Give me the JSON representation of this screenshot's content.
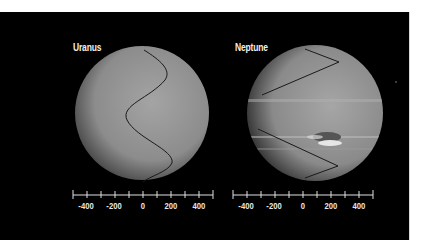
{
  "planets": [
    {
      "name": "Uranus",
      "scale": {
        "ticks": [
          "-400",
          "-200",
          "0",
          "200",
          "400"
        ]
      }
    },
    {
      "name": "Neptune",
      "scale": {
        "ticks": [
          "-400",
          "-200",
          "0",
          "200",
          "400"
        ]
      }
    }
  ],
  "colors": {
    "background": "#000000",
    "planet_uranus": "#8a8a8a",
    "planet_neptune": "#8c8c8c",
    "profile_line": "#1a1a1a",
    "axis": "#e0e0e0"
  }
}
